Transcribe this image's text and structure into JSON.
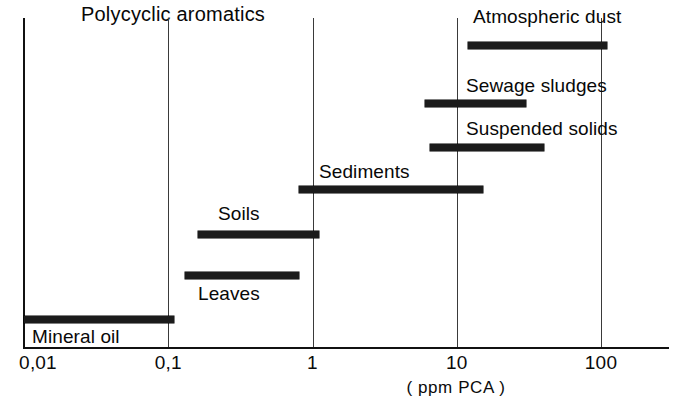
{
  "chart_data": {
    "type": "bar",
    "orientation": "horizontal-range",
    "title": "Polycyclic aromatics",
    "xlabel": "( ppm  PCA )",
    "ylabel": "",
    "scale": "log",
    "xlim": [
      0.01,
      200
    ],
    "grid": true,
    "legend": "none",
    "tick_labels": [
      "0,01",
      "0,1",
      "1",
      "10",
      "100"
    ],
    "tick_values": [
      0.01,
      0.1,
      1,
      10,
      100
    ],
    "categories": [
      "Atmospheric dust",
      "Sewage sludges",
      "Suspended solids",
      "Sediments",
      "Soils",
      "Leaves",
      "Mineral oil"
    ],
    "ranges": [
      {
        "name": "Atmospheric dust",
        "low": 12,
        "high": 110
      },
      {
        "name": "Sewage sludges",
        "low": 6,
        "high": 30
      },
      {
        "name": "Suspended solids",
        "low": 6.5,
        "high": 40
      },
      {
        "name": "Sediments",
        "low": 0.8,
        "high": 15
      },
      {
        "name": "Soils",
        "low": 0.16,
        "high": 1.1
      },
      {
        "name": "Leaves",
        "low": 0.13,
        "high": 0.8
      },
      {
        "name": "Mineral oil",
        "low": 0.01,
        "high": 0.11
      }
    ]
  },
  "chart": {
    "title": "Polycyclic aromatics",
    "axis_title": "( ppm  PCA )",
    "ticks": [
      {
        "label": "0,01",
        "value": 0.01
      },
      {
        "label": "0,1",
        "value": 0.1
      },
      {
        "label": "1",
        "value": 1
      },
      {
        "label": "10",
        "value": 10
      },
      {
        "label": "100",
        "value": 100
      }
    ],
    "bars": [
      {
        "label": "Atmospheric dust",
        "low": 12,
        "high": 110,
        "label_x": 473,
        "label_y": 6,
        "bar_y": 42
      },
      {
        "label": "Sewage sludges",
        "low": 6,
        "high": 30,
        "label_x": 466,
        "label_y": 75,
        "bar_y": 100
      },
      {
        "label": "Suspended solids",
        "low": 6.5,
        "high": 40,
        "label_x": 466,
        "label_y": 118,
        "bar_y": 144
      },
      {
        "label": "Sediments",
        "low": 0.8,
        "high": 15,
        "label_x": 319,
        "label_y": 161,
        "bar_y": 186
      },
      {
        "label": "Soils",
        "low": 0.16,
        "high": 1.1,
        "label_x": 218,
        "label_y": 203,
        "bar_y": 231
      },
      {
        "label": "Leaves",
        "low": 0.13,
        "high": 0.8,
        "label_x": 198,
        "label_y": 283,
        "bar_y": 272
      },
      {
        "label": "Mineral oil",
        "low": 0.01,
        "high": 0.11,
        "label_x": 32,
        "label_y": 326,
        "bar_y": 316
      }
    ]
  }
}
